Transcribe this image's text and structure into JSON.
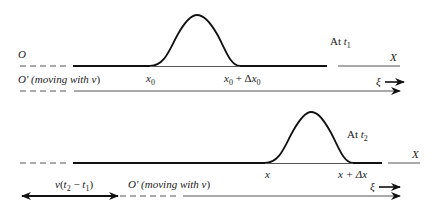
{
  "diagram": {
    "top_panel": {
      "origin_label": "O",
      "moving_frame_label": "O′ (moving with ",
      "moving_frame_var": "v",
      "moving_frame_close": ")",
      "time_label_prefix": "At ",
      "time_var": "t",
      "time_sub": "1",
      "axis_label": "X",
      "pulse_start_label": "x",
      "pulse_start_sub": "0",
      "pulse_end_label_a": "x",
      "pulse_end_sub_a": "0",
      "pulse_end_label_plus": " + Δ",
      "pulse_end_label_b": "x",
      "pulse_end_sub_b": "0",
      "xi_label": "ξ"
    },
    "bottom_panel": {
      "time_label_prefix": "At ",
      "time_var": "t",
      "time_sub": "2",
      "axis_label": "X",
      "pulse_start_label": "x",
      "pulse_end_label": "x + Δx",
      "xi_label": "ξ",
      "displacement_label_v": "v",
      "displacement_label_paren": "(",
      "displacement_t2": "t",
      "displacement_t2_sub": "2",
      "displacement_minus": " − ",
      "displacement_t1": "t",
      "displacement_t1_sub": "1",
      "displacement_close": ")",
      "moving_frame_label": "O′ (moving with ",
      "moving_frame_var": "v",
      "moving_frame_close": ")"
    }
  }
}
